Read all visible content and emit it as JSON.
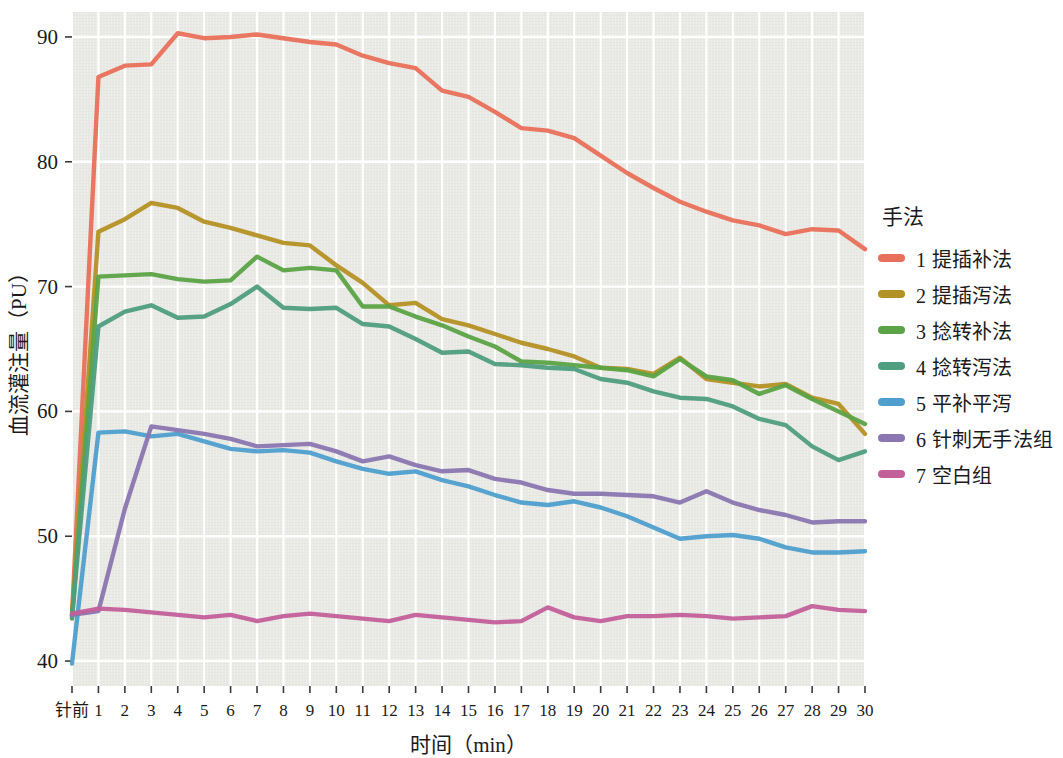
{
  "chart_data": {
    "type": "line",
    "title": "",
    "xlabel": "时间（min）",
    "ylabel": "血流灌注量（PU）",
    "legend_title": "手法",
    "legend_position": "right",
    "grid": true,
    "background_color": "#e9e9e5",
    "gridline_color": "#ffffff",
    "xlim_labels": [
      "针前",
      "30"
    ],
    "ylim": [
      38,
      92
    ],
    "yticks": [
      40,
      50,
      60,
      70,
      80,
      90
    ],
    "categories": [
      "针前",
      "1",
      "2",
      "3",
      "4",
      "5",
      "6",
      "7",
      "8",
      "9",
      "10",
      "11",
      "12",
      "13",
      "14",
      "15",
      "16",
      "17",
      "18",
      "19",
      "20",
      "21",
      "22",
      "23",
      "24",
      "25",
      "26",
      "27",
      "28",
      "29",
      "30"
    ],
    "series": [
      {
        "name": "1 提插补法",
        "color": "#e8705a",
        "values": [
          43.6,
          86.8,
          87.7,
          87.8,
          90.3,
          89.9,
          90.0,
          90.2,
          89.9,
          89.6,
          89.4,
          88.5,
          87.9,
          87.5,
          85.7,
          85.2,
          84.0,
          82.7,
          82.5,
          81.9,
          80.5,
          79.1,
          77.9,
          76.8,
          76.0,
          75.3,
          74.9,
          74.2,
          74.6,
          74.5,
          73.0
        ]
      },
      {
        "name": "2 提插泻法",
        "color": "#b49125",
        "values": [
          43.7,
          74.4,
          75.4,
          76.7,
          76.3,
          75.2,
          74.7,
          74.1,
          73.5,
          73.3,
          71.7,
          70.3,
          68.5,
          68.7,
          67.4,
          66.9,
          66.2,
          65.5,
          65.0,
          64.4,
          63.5,
          63.4,
          63.0,
          64.3,
          62.6,
          62.3,
          62.0,
          62.2,
          61.1,
          60.6,
          58.2
        ]
      },
      {
        "name": "3 捻转补法",
        "color": "#5ba346",
        "values": [
          43.4,
          70.8,
          70.9,
          71.0,
          70.6,
          70.4,
          70.5,
          72.4,
          71.3,
          71.5,
          71.3,
          68.4,
          68.4,
          67.6,
          66.9,
          66.0,
          65.2,
          64.0,
          63.9,
          63.7,
          63.5,
          63.3,
          62.8,
          64.2,
          62.8,
          62.5,
          61.4,
          62.1,
          61.0,
          60.0,
          59.0
        ]
      },
      {
        "name": "4 捻转泻法",
        "color": "#4f9e7f",
        "values": [
          43.5,
          66.8,
          68.0,
          68.5,
          67.5,
          67.6,
          68.6,
          70.0,
          68.3,
          68.2,
          68.3,
          67.0,
          66.8,
          65.8,
          64.7,
          64.8,
          63.8,
          63.7,
          63.5,
          63.4,
          62.6,
          62.3,
          61.6,
          61.1,
          61.0,
          60.4,
          59.4,
          58.9,
          57.2,
          56.1,
          56.8
        ]
      },
      {
        "name": "5 平补平泻",
        "color": "#4e9fcd",
        "values": [
          39.8,
          58.3,
          58.4,
          58.0,
          58.2,
          57.6,
          57.0,
          56.8,
          56.9,
          56.7,
          56.0,
          55.4,
          55.0,
          55.2,
          54.5,
          54.0,
          53.3,
          52.7,
          52.5,
          52.8,
          52.3,
          51.6,
          50.7,
          49.8,
          50.0,
          50.1,
          49.8,
          49.1,
          48.7,
          48.7,
          48.8
        ]
      },
      {
        "name": "6 针刺无手法组",
        "color": "#8a76b0",
        "values": [
          43.7,
          44.0,
          52.2,
          58.8,
          58.5,
          58.2,
          57.8,
          57.2,
          57.3,
          57.4,
          56.8,
          56.0,
          56.4,
          55.7,
          55.2,
          55.3,
          54.6,
          54.3,
          53.7,
          53.4,
          53.4,
          53.3,
          53.2,
          52.7,
          53.6,
          52.7,
          52.1,
          51.7,
          51.1,
          51.2,
          51.2
        ]
      },
      {
        "name": "7 空白组",
        "color": "#c3609a",
        "values": [
          43.8,
          44.2,
          44.1,
          43.9,
          43.7,
          43.5,
          43.7,
          43.2,
          43.6,
          43.8,
          43.6,
          43.4,
          43.2,
          43.7,
          43.5,
          43.3,
          43.1,
          43.2,
          44.3,
          43.5,
          43.2,
          43.6,
          43.6,
          43.7,
          43.6,
          43.4,
          43.5,
          43.6,
          44.4,
          44.1,
          44.0
        ]
      }
    ]
  },
  "axes": {
    "ytick_labels": [
      "90",
      "80",
      "70",
      "60",
      "50",
      "40"
    ],
    "xtick_labels": [
      "针前",
      "1",
      "2",
      "3",
      "4",
      "5",
      "6",
      "7",
      "8",
      "9",
      "10",
      "11",
      "12",
      "13",
      "14",
      "15",
      "16",
      "17",
      "18",
      "19",
      "20",
      "21",
      "22",
      "23",
      "24",
      "25",
      "26",
      "27",
      "28",
      "29",
      "30"
    ],
    "x_title": "时间（min）",
    "y_title": "血流灌注量（PU）"
  },
  "legend": {
    "title": "手法",
    "items": [
      {
        "label": "1 提插补法",
        "color": "#e8705a"
      },
      {
        "label": "2 提插泻法",
        "color": "#b49125"
      },
      {
        "label": "3 捻转补法",
        "color": "#5ba346"
      },
      {
        "label": "4 捻转泻法",
        "color": "#4f9e7f"
      },
      {
        "label": "5 平补平泻",
        "color": "#4e9fcd"
      },
      {
        "label": "6 针刺无手法组",
        "color": "#8a76b0"
      },
      {
        "label": "7 空白组",
        "color": "#c3609a"
      }
    ]
  }
}
